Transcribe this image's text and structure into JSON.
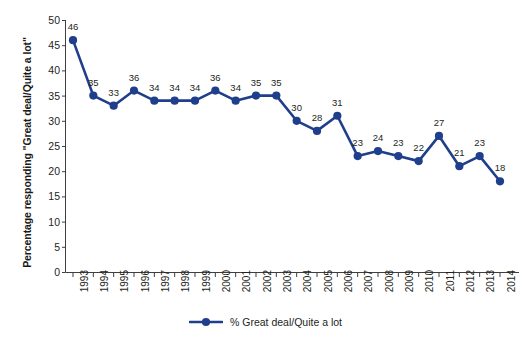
{
  "chart_data": {
    "type": "line",
    "title": "",
    "subtitle": "",
    "xlabel": "",
    "ylabel": "Percentage responding \"Great deal/Quite a lot\"",
    "xlim": [
      1993,
      2014
    ],
    "ylim": [
      0,
      50
    ],
    "y_ticks": [
      0,
      5,
      10,
      15,
      20,
      25,
      30,
      35,
      40,
      45,
      50
    ],
    "grid": false,
    "legend_position": "bottom-center",
    "series_color": "#1F3E8C",
    "categories": [
      "1993",
      "1994",
      "1995",
      "1996",
      "1997",
      "1998",
      "1999",
      "2000",
      "2001",
      "2002",
      "2003",
      "2004",
      "2005",
      "2006",
      "2007",
      "2008",
      "2009",
      "2010",
      "2011",
      "2012",
      "2013",
      "2014"
    ],
    "series": [
      {
        "name": "% Great deal/Quite a lot",
        "values": [
          46,
          35,
          33,
          36,
          34,
          34,
          34,
          36,
          34,
          35,
          35,
          30,
          28,
          31,
          23,
          24,
          23,
          22,
          27,
          21,
          23,
          18
        ]
      }
    ],
    "point_labels": [
      "46",
      "35",
      "33",
      "36",
      "34",
      "34",
      "34",
      "36",
      "34",
      "35",
      "35",
      "30",
      "28",
      "31",
      "23",
      "24",
      "23",
      "22",
      "27",
      "21",
      "23",
      "18"
    ]
  },
  "legend": {
    "label": "% Great deal/Quite a lot",
    "marker": "line-circle-marker"
  },
  "axes": {
    "y_title": "Percentage responding \"Great deal/Quite a lot\"",
    "y_tick_labels": [
      "50",
      "45",
      "40",
      "35",
      "30",
      "25",
      "20",
      "15",
      "10",
      "5",
      "0"
    ],
    "x_tick_labels": [
      "1993",
      "1994",
      "1995",
      "1996",
      "1997",
      "1998",
      "1999",
      "2000",
      "2001",
      "2002",
      "2003",
      "2004",
      "2005",
      "2006",
      "2007",
      "2008",
      "2009",
      "2010",
      "2011",
      "2012",
      "2013",
      "2014"
    ]
  },
  "colors": {
    "series": "#1F3E8C",
    "axis": "#3f3f3f",
    "text": "#231f20",
    "background": "#ffffff"
  }
}
